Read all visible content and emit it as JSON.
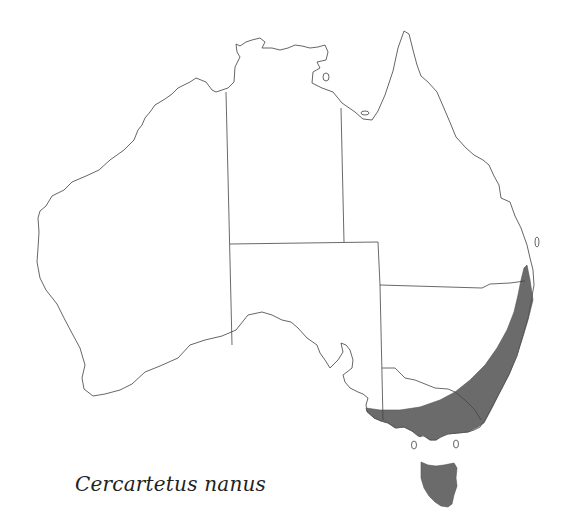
{
  "map": {
    "title": "Cercartetus nanus",
    "subject": "Distribution map of Australia",
    "regions": [
      "Western Australia",
      "Northern Territory",
      "Queensland",
      "South Australia",
      "New South Wales",
      "Victoria",
      "Tasmania"
    ],
    "shaded_range": "Southeastern coastal strip (eastern NSW, southern Victoria, southeastern South Australia) and Tasmania",
    "colors": {
      "range_fill": "#6b6b6b",
      "outline": "#555555",
      "background": "#ffffff"
    }
  }
}
